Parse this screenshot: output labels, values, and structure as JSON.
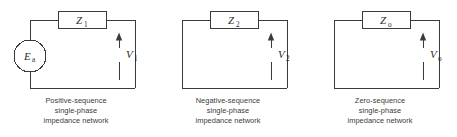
{
  "figure": {
    "line_color": "#3a3a3a",
    "text_color": "#2b2b2b",
    "background": "#ffffff"
  },
  "networks": [
    {
      "id": "positive-sequence",
      "impedance_label": "Z",
      "impedance_subscript": "1",
      "voltage_label": "V",
      "voltage_subscript": "1",
      "has_source": true,
      "source_label": "E",
      "source_subscript": "a",
      "caption": {
        "line1": "Positive-sequence",
        "line2": "single-phase",
        "line3": "impedance network"
      }
    },
    {
      "id": "negative-sequence",
      "impedance_label": "Z",
      "impedance_subscript": "2",
      "voltage_label": "V",
      "voltage_subscript": "2",
      "has_source": false,
      "source_label": "",
      "source_subscript": "",
      "caption": {
        "line1": "Negative-sequence",
        "line2": "single-phase",
        "line3": "impedance network"
      }
    },
    {
      "id": "zero-sequence",
      "impedance_label": "Z",
      "impedance_subscript": "o",
      "voltage_label": "V",
      "voltage_subscript": "o",
      "has_source": false,
      "source_label": "",
      "source_subscript": "",
      "caption": {
        "line1": "Zero-sequence",
        "line2": "single-phase",
        "line3": "impedance network"
      }
    }
  ]
}
